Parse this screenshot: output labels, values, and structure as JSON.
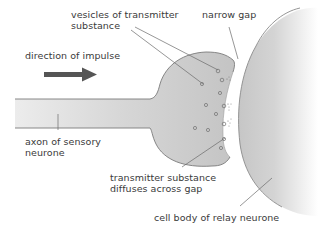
{
  "diagram": {
    "labels": {
      "vesicles": [
        "vesicles of transmitter",
        "substance"
      ],
      "narrow_gap": "narrow gap",
      "direction": "direction of impulse",
      "axon": [
        "axon of sensory",
        "neurone"
      ],
      "diffuses": [
        "transmitter substance",
        "diffuses across gap"
      ],
      "cell_body": "cell body of relay neurone"
    },
    "icons": {
      "arrow": "right-arrow-icon"
    },
    "colors": {
      "neurone_fill": "#c9c9c9",
      "neurone_fill_light": "#ececec",
      "outline": "#7a7a7a",
      "leader_line": "#6a6a6a",
      "arrow": "#555555",
      "text": "#3a3a3a",
      "background": "#ffffff"
    }
  }
}
